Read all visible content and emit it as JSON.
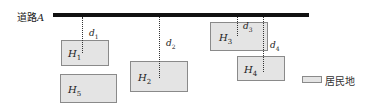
{
  "diagram": {
    "road": {
      "name": "道路",
      "var": "A"
    },
    "settlements": [
      {
        "id": "H1",
        "letter": "H",
        "sub": "1"
      },
      {
        "id": "H2",
        "letter": "H",
        "sub": "2"
      },
      {
        "id": "H3",
        "letter": "H",
        "sub": "3"
      },
      {
        "id": "H4",
        "letter": "H",
        "sub": "4"
      },
      {
        "id": "H5",
        "letter": "H",
        "sub": "5"
      }
    ],
    "distances": [
      {
        "id": "d1",
        "letter": "d",
        "sub": "1"
      },
      {
        "id": "d2",
        "letter": "d",
        "sub": "2"
      },
      {
        "id": "d3",
        "letter": "d",
        "sub": "3"
      },
      {
        "id": "d4",
        "letter": "d",
        "sub": "4"
      }
    ],
    "legend": {
      "label": "居民地"
    },
    "colors": {
      "road": "#111111",
      "settlement_fill": "#e4e4e4",
      "settlement_border": "#8a8a8a"
    }
  }
}
